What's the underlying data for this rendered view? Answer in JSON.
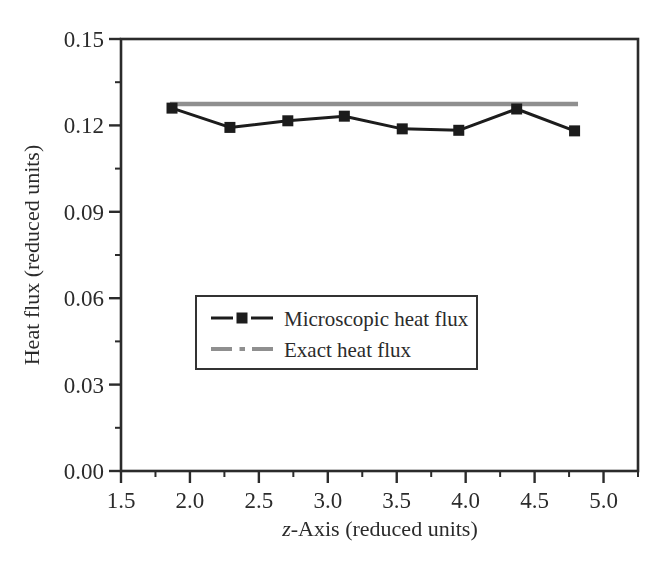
{
  "figure": {
    "background": "#ffffff",
    "axis_color": "#2b2b2b",
    "series_black": "#1c1c1c",
    "series_gray": "#8f8f8f"
  },
  "chart_data": {
    "type": "line",
    "title": "",
    "xlabel": "z-Axis (reduced units)",
    "xlabel_parts": {
      "italic": "z",
      "rest": "-Axis (reduced units)"
    },
    "ylabel": "Heat flux (reduced units)",
    "xlim": [
      1.5,
      5.25
    ],
    "ylim": [
      0.0,
      0.15
    ],
    "grid": false,
    "x_major_ticks": [
      1.5,
      2.0,
      2.5,
      3.0,
      3.5,
      4.0,
      4.5,
      5.0
    ],
    "x_tick_labels": [
      "1.5",
      "2.0",
      "2.5",
      "3.0",
      "3.5",
      "4.0",
      "4.5",
      "5.0"
    ],
    "x_minor_ticks": [
      1.75,
      2.25,
      2.75,
      3.25,
      3.75,
      4.25,
      4.75,
      5.25
    ],
    "y_major_ticks": [
      0.0,
      0.03,
      0.06,
      0.09,
      0.12,
      0.15
    ],
    "y_tick_labels": [
      "0.00",
      "0.03",
      "0.06",
      "0.09",
      "0.12",
      "0.15"
    ],
    "y_minor_ticks": [
      0.015,
      0.045,
      0.075,
      0.105,
      0.135
    ],
    "legend_position": "inside lower-left",
    "series": [
      {
        "name": "Microscopic heat flux",
        "style": "solid line with filled square markers",
        "color": "#1c1c1c",
        "x": [
          1.87,
          2.29,
          2.71,
          3.12,
          3.54,
          3.95,
          4.37,
          4.79
        ],
        "y": [
          0.126,
          0.1193,
          0.1216,
          0.1232,
          0.1188,
          0.1183,
          0.1257,
          0.1181
        ]
      },
      {
        "name": "Exact heat flux",
        "style": "thick gray line (dash-dot in legend)",
        "color": "#8f8f8f",
        "x": [
          1.855,
          4.815
        ],
        "y": [
          0.1274,
          0.1274
        ]
      }
    ],
    "legend": [
      {
        "label": "Microscopic heat flux"
      },
      {
        "label": "Exact heat flux"
      }
    ]
  }
}
